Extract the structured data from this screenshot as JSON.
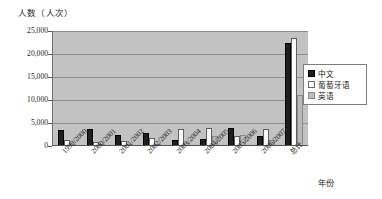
{
  "chart_data": {
    "type": "bar",
    "title": "",
    "xlabel": "年份",
    "ylabel": "人数（人次）",
    "ylim": [
      0,
      25000
    ],
    "ytick_labels": [
      "25,000",
      "20,000",
      "15,000",
      "10,000",
      "5,000",
      "0"
    ],
    "ytick_values": [
      25000,
      20000,
      15000,
      10000,
      5000,
      0
    ],
    "grid": true,
    "legend_position": "right",
    "categories": [
      "1999/2000",
      "2000/2001",
      "2001/2002",
      "2002/2003",
      "2003/2004",
      "2004/2005",
      "2005/2006",
      "2006/2007",
      "总计"
    ],
    "series": [
      {
        "name": "中文",
        "color": "#201f1f",
        "values": [
          3500,
          3600,
          2400,
          2900,
          1300,
          1500,
          4000,
          2200,
          22500
        ]
      },
      {
        "name": "葡萄牙语",
        "color": "#ffffff",
        "values": [
          1200,
          800,
          1100,
          1700,
          3700,
          3900,
          2100,
          3700,
          23500
        ]
      },
      {
        "name": "英语",
        "color": "#bdbdbd",
        "values": [
          200,
          200,
          500,
          300,
          700,
          2200,
          2400,
          1200,
          11000
        ]
      }
    ]
  },
  "legend": {
    "items": [
      {
        "label": "中文"
      },
      {
        "label": "葡萄牙语"
      },
      {
        "label": "英语"
      }
    ]
  }
}
